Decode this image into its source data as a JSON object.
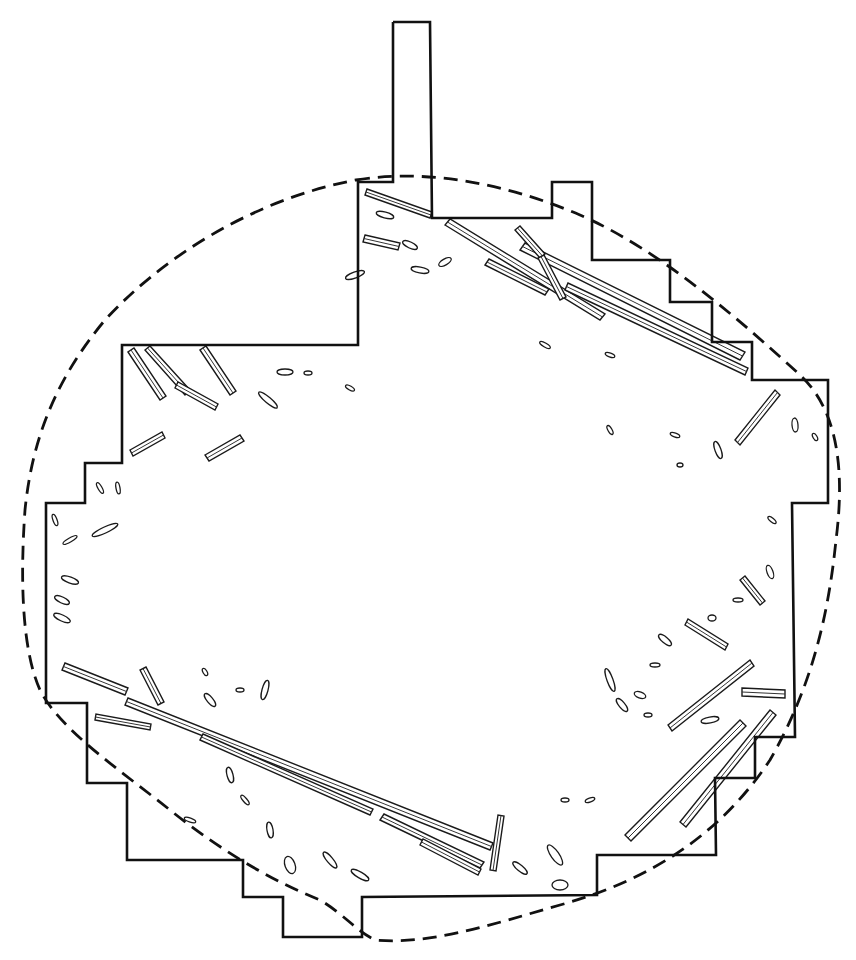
{
  "figure": {
    "kind": "excavation plan drawing",
    "colors": {
      "ink": "#111111",
      "background": "#ffffff"
    },
    "legend": {
      "excavation_limit": "solid line",
      "feature_boundary": "dashed line",
      "timbers": "hatched elongated shapes"
    }
  },
  "excavation_outline_points": "393,22 430,22 432,218 552,218 552,182 592,182 592,260 670,260 670,302 712,302 712,342 752,342 752,380 828,380 828,503 792,503 795,737 755,737 755,778 715,778 716,855 597,855 597,895 362,897 362,937 283,937 283,897 243,897 243,860 127,860 127,783 87,783 87,703 46,703 46,503 85,503 85,463 122,463 122,345 358,345 358,182 393,182 393,22",
  "feature_boundary_path": "M 356,180 C 430,168 510,185 580,215 C 660,250 740,320 800,375 C 838,410 845,470 836,540 C 828,620 810,690 770,760 C 720,835 650,880 560,905 C 490,925 430,945 375,940 C 355,930 345,915 320,900 C 270,880 220,850 170,810 C 120,770 60,730 40,690 C 22,650 20,580 25,510 C 32,440 55,380 105,320 C 160,260 250,200 356,180 Z",
  "timbers": [
    {
      "id": "t-top-long-1",
      "d": "M 445,225 L 600,320 L 605,314 L 450,219 Z"
    },
    {
      "id": "t-top-long-2",
      "d": "M 520,250 L 740,360 L 745,352 L 525,243 Z"
    },
    {
      "id": "t-top-long-3",
      "d": "M 565,290 L 745,375 L 748,368 L 568,283 Z"
    },
    {
      "id": "t-top-1",
      "d": "M 365,195 L 430,218 L 432,212 L 367,189 Z"
    },
    {
      "id": "t-top-2",
      "d": "M 365,235 L 400,243 L 398,250 L 363,242 Z"
    },
    {
      "id": "t-top-3",
      "d": "M 485,265 L 545,295 L 549,289 L 489,259 Z"
    },
    {
      "id": "t-top-4",
      "d": "M 515,230 L 540,258 L 545,254 L 520,226 Z"
    },
    {
      "id": "t-top-5",
      "d": "M 538,258 L 560,300 L 566,297 L 544,255 Z"
    },
    {
      "id": "t-nw-1",
      "d": "M 128,352 L 160,400 L 166,396 L 134,348 Z"
    },
    {
      "id": "t-nw-2",
      "d": "M 145,350 L 185,395 L 190,390 L 150,346 Z"
    },
    {
      "id": "t-nw-3",
      "d": "M 130,450 L 162,432 L 165,438 L 133,456 Z"
    },
    {
      "id": "t-nw-4",
      "d": "M 200,350 L 230,395 L 236,391 L 206,346 Z"
    },
    {
      "id": "t-nw-5",
      "d": "M 205,455 L 240,435 L 244,441 L 209,461 Z"
    },
    {
      "id": "t-nw-6",
      "d": "M 175,388 L 215,410 L 218,404 L 178,382 Z"
    },
    {
      "id": "t-sw-long",
      "d": "M 125,705 L 490,850 L 493,843 L 128,698 Z"
    },
    {
      "id": "t-sw-long-2",
      "d": "M 200,740 L 370,815 L 373,809 L 203,734 Z"
    },
    {
      "id": "t-sw-1",
      "d": "M 62,670 L 125,695 L 128,688 L 65,663 Z"
    },
    {
      "id": "t-sw-2",
      "d": "M 95,720 L 150,730 L 151,724 L 96,714 Z"
    },
    {
      "id": "t-sw-3",
      "d": "M 140,670 L 158,705 L 164,702 L 146,667 Z"
    },
    {
      "id": "t-sw-4",
      "d": "M 380,820 L 480,868 L 484,862 L 384,814 Z"
    },
    {
      "id": "t-sw-5",
      "d": "M 420,845 L 478,875 L 481,869 L 423,839 Z"
    },
    {
      "id": "t-s-1",
      "d": "M 490,870 L 498,815 L 504,816 L 496,871 Z"
    },
    {
      "id": "t-se-long-1",
      "d": "M 668,725 L 750,660 L 754,666 L 672,731 Z"
    },
    {
      "id": "t-se-long-2",
      "d": "M 625,835 L 740,720 L 746,726 L 631,841 Z"
    },
    {
      "id": "t-se-long-3",
      "d": "M 680,822 L 770,710 L 776,715 L 686,827 Z"
    },
    {
      "id": "t-se-1",
      "d": "M 742,688 L 785,690 L 785,698 L 742,696 Z"
    },
    {
      "id": "t-e-1",
      "d": "M 735,440 L 775,390 L 780,395 L 740,445 Z"
    },
    {
      "id": "t-e-2",
      "d": "M 740,580 L 760,605 L 765,601 L 745,576 Z"
    },
    {
      "id": "t-e-3",
      "d": "M 685,625 L 725,650 L 728,644 L 688,619 Z"
    }
  ],
  "fragments": [
    {
      "cx": 355,
      "cy": 275,
      "rx": 10,
      "ry": 3,
      "r": -20
    },
    {
      "cx": 420,
      "cy": 270,
      "rx": 9,
      "ry": 3,
      "r": 10
    },
    {
      "cx": 445,
      "cy": 262,
      "rx": 7,
      "ry": 3,
      "r": -30
    },
    {
      "cx": 385,
      "cy": 215,
      "rx": 9,
      "ry": 3,
      "r": 15
    },
    {
      "cx": 410,
      "cy": 245,
      "rx": 8,
      "ry": 3,
      "r": 25
    },
    {
      "cx": 285,
      "cy": 372,
      "rx": 8,
      "ry": 3,
      "r": 0
    },
    {
      "cx": 268,
      "cy": 400,
      "rx": 12,
      "ry": 3,
      "r": 40
    },
    {
      "cx": 350,
      "cy": 388,
      "rx": 5,
      "ry": 2,
      "r": 30
    },
    {
      "cx": 308,
      "cy": 373,
      "rx": 4,
      "ry": 2,
      "r": 0
    },
    {
      "cx": 545,
      "cy": 345,
      "rx": 6,
      "ry": 2,
      "r": 30
    },
    {
      "cx": 610,
      "cy": 355,
      "rx": 5,
      "ry": 2,
      "r": 20
    },
    {
      "cx": 610,
      "cy": 430,
      "rx": 5,
      "ry": 2,
      "r": 60
    },
    {
      "cx": 675,
      "cy": 435,
      "rx": 5,
      "ry": 2,
      "r": 20
    },
    {
      "cx": 718,
      "cy": 450,
      "rx": 9,
      "ry": 3,
      "r": 70
    },
    {
      "cx": 795,
      "cy": 425,
      "rx": 7,
      "ry": 3,
      "r": 85
    },
    {
      "cx": 815,
      "cy": 437,
      "rx": 4,
      "ry": 2,
      "r": 60
    },
    {
      "cx": 680,
      "cy": 465,
      "rx": 3,
      "ry": 2,
      "r": 0
    },
    {
      "cx": 772,
      "cy": 520,
      "rx": 5,
      "ry": 2,
      "r": 40
    },
    {
      "cx": 770,
      "cy": 572,
      "rx": 7,
      "ry": 3,
      "r": 70
    },
    {
      "cx": 55,
      "cy": 520,
      "rx": 6,
      "ry": 2,
      "r": 70
    },
    {
      "cx": 70,
      "cy": 540,
      "rx": 8,
      "ry": 2,
      "r": -30
    },
    {
      "cx": 105,
      "cy": 530,
      "rx": 14,
      "ry": 3,
      "r": -25
    },
    {
      "cx": 100,
      "cy": 488,
      "rx": 6,
      "ry": 2,
      "r": 60
    },
    {
      "cx": 118,
      "cy": 488,
      "rx": 6,
      "ry": 2,
      "r": 80
    },
    {
      "cx": 70,
      "cy": 580,
      "rx": 9,
      "ry": 3,
      "r": 20
    },
    {
      "cx": 62,
      "cy": 600,
      "rx": 8,
      "ry": 3,
      "r": 25
    },
    {
      "cx": 62,
      "cy": 618,
      "rx": 9,
      "ry": 3,
      "r": 25
    },
    {
      "cx": 265,
      "cy": 690,
      "rx": 10,
      "ry": 3,
      "r": -75
    },
    {
      "cx": 210,
      "cy": 700,
      "rx": 8,
      "ry": 3,
      "r": 50
    },
    {
      "cx": 240,
      "cy": 690,
      "rx": 4,
      "ry": 2,
      "r": 0
    },
    {
      "cx": 205,
      "cy": 672,
      "rx": 4,
      "ry": 2,
      "r": 60
    },
    {
      "cx": 270,
      "cy": 830,
      "rx": 8,
      "ry": 3,
      "r": 80
    },
    {
      "cx": 290,
      "cy": 865,
      "rx": 9,
      "ry": 5,
      "r": 70
    },
    {
      "cx": 230,
      "cy": 775,
      "rx": 8,
      "ry": 3,
      "r": 75
    },
    {
      "cx": 245,
      "cy": 800,
      "rx": 6,
      "ry": 2,
      "r": 50
    },
    {
      "cx": 190,
      "cy": 820,
      "rx": 6,
      "ry": 2,
      "r": 20
    },
    {
      "cx": 330,
      "cy": 860,
      "rx": 10,
      "ry": 3,
      "r": 50
    },
    {
      "cx": 360,
      "cy": 875,
      "rx": 10,
      "ry": 3,
      "r": 30
    },
    {
      "cx": 555,
      "cy": 855,
      "rx": 12,
      "ry": 4,
      "r": 55
    },
    {
      "cx": 520,
      "cy": 868,
      "rx": 9,
      "ry": 3,
      "r": 40
    },
    {
      "cx": 565,
      "cy": 800,
      "rx": 4,
      "ry": 2,
      "r": 0
    },
    {
      "cx": 590,
      "cy": 800,
      "rx": 5,
      "ry": 2,
      "r": -20
    },
    {
      "cx": 560,
      "cy": 885,
      "rx": 8,
      "ry": 5,
      "r": 0
    },
    {
      "cx": 610,
      "cy": 680,
      "rx": 12,
      "ry": 3,
      "r": 70
    },
    {
      "cx": 622,
      "cy": 705,
      "rx": 8,
      "ry": 3,
      "r": 50
    },
    {
      "cx": 640,
      "cy": 695,
      "rx": 6,
      "ry": 3,
      "r": 20
    },
    {
      "cx": 655,
      "cy": 665,
      "rx": 5,
      "ry": 2,
      "r": 0
    },
    {
      "cx": 665,
      "cy": 640,
      "rx": 8,
      "ry": 3,
      "r": 40
    },
    {
      "cx": 710,
      "cy": 720,
      "rx": 9,
      "ry": 3,
      "r": -10
    },
    {
      "cx": 648,
      "cy": 715,
      "rx": 4,
      "ry": 2,
      "r": 0
    },
    {
      "cx": 712,
      "cy": 618,
      "rx": 4,
      "ry": 3,
      "r": 0
    },
    {
      "cx": 738,
      "cy": 600,
      "rx": 5,
      "ry": 2,
      "r": 0
    }
  ]
}
